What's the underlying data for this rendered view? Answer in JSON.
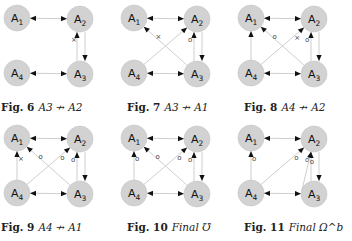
{
  "colors": {
    "node_fill": "#d2d2d2",
    "node_stroke": "#c4c4c4",
    "edge": "#c8c8c8",
    "arrowhead": "#111111",
    "mark": "#555555"
  },
  "nodes": [
    "A1",
    "A2",
    "A3",
    "A4"
  ],
  "figures": [
    {
      "id": "fig6",
      "label": "Fig. 6",
      "relation": "A3 ↛ A2",
      "edges": [
        {
          "from": "A1",
          "to": "A2",
          "type": "bidirectional"
        },
        {
          "from": "A4",
          "to": "A3",
          "type": "bidirectional"
        },
        {
          "from": "A3",
          "to": "A2",
          "type": "directed",
          "mark": "×"
        },
        {
          "from": "A2",
          "to": "A3",
          "type": "directed"
        }
      ]
    },
    {
      "id": "fig7",
      "label": "Fig. 7",
      "relation": "A3 ↛ A1",
      "edges": [
        {
          "from": "A1",
          "to": "A2",
          "type": "bidirectional"
        },
        {
          "from": "A4",
          "to": "A3",
          "type": "bidirectional"
        },
        {
          "from": "A3",
          "to": "A2",
          "type": "directed",
          "mark": "o"
        },
        {
          "from": "A2",
          "to": "A3",
          "type": "directed"
        },
        {
          "from": "A4",
          "to": "A2",
          "type": "directed"
        },
        {
          "from": "A3",
          "to": "A1",
          "type": "directed",
          "mark": "×"
        }
      ]
    },
    {
      "id": "fig8",
      "label": "Fig. 8",
      "relation": "A4 ↛ A2",
      "edges": [
        {
          "from": "A1",
          "to": "A2",
          "type": "bidirectional"
        },
        {
          "from": "A4",
          "to": "A3",
          "type": "bidirectional"
        },
        {
          "from": "A3",
          "to": "A2",
          "type": "directed",
          "mark": "o"
        },
        {
          "from": "A2",
          "to": "A3",
          "type": "directed"
        },
        {
          "from": "A4",
          "to": "A1",
          "type": "directed"
        },
        {
          "from": "A4",
          "to": "A2",
          "type": "directed",
          "mark": "×"
        },
        {
          "from": "A3",
          "to": "A1",
          "type": "directed",
          "mark": "o"
        }
      ]
    },
    {
      "id": "fig9",
      "label": "Fig. 9",
      "relation": "A4 ↛ A1",
      "edges": [
        {
          "from": "A1",
          "to": "A2",
          "type": "bidirectional"
        },
        {
          "from": "A4",
          "to": "A3",
          "type": "bidirectional"
        },
        {
          "from": "A3",
          "to": "A2",
          "type": "directed",
          "mark": "o"
        },
        {
          "from": "A2",
          "to": "A3",
          "type": "directed"
        },
        {
          "from": "A4",
          "to": "A1",
          "type": "directed",
          "mark": "×"
        },
        {
          "from": "A4",
          "to": "A2",
          "type": "directed",
          "mark": "o"
        },
        {
          "from": "A3",
          "to": "A1",
          "type": "directed",
          "mark": "o"
        }
      ]
    },
    {
      "id": "fig10",
      "label": "Fig. 10",
      "relation": "Final ℧",
      "edges": [
        {
          "from": "A1",
          "to": "A2",
          "type": "bidirectional"
        },
        {
          "from": "A4",
          "to": "A3",
          "type": "bidirectional"
        },
        {
          "from": "A3",
          "to": "A2",
          "type": "directed",
          "mark": "o"
        },
        {
          "from": "A2",
          "to": "A3",
          "type": "directed"
        },
        {
          "from": "A4",
          "to": "A1",
          "type": "directed",
          "mark": "o"
        },
        {
          "from": "A4",
          "to": "A2",
          "type": "directed",
          "mark": "o"
        },
        {
          "from": "A3",
          "to": "A1",
          "type": "directed",
          "mark": "o"
        }
      ]
    },
    {
      "id": "fig11",
      "label": "Fig. 11",
      "relation": "Final Ω^b",
      "edges": [
        {
          "from": "A1",
          "to": "A2",
          "type": "bidirectional"
        },
        {
          "from": "A4",
          "to": "A3",
          "type": "bidirectional"
        },
        {
          "from": "A3",
          "to": "A2",
          "type": "directed",
          "mark": "o"
        },
        {
          "from": "A2",
          "to": "A3",
          "type": "directed"
        },
        {
          "from": "A4",
          "to": "A1",
          "type": "directed",
          "mark": "o"
        },
        {
          "from": "A4",
          "to": "A2",
          "type": "directed",
          "mark": "o"
        },
        {
          "from": "A1",
          "to": "A2c",
          "type": "partial",
          "mark": "o"
        }
      ]
    }
  ]
}
